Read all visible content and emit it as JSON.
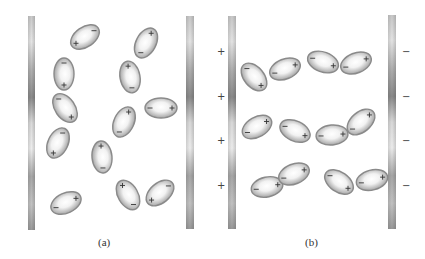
{
  "figure": {
    "panels": [
      {
        "id": "a",
        "caption": "(a)",
        "caption_pos": [
          106,
          248
        ],
        "plates": [
          {
            "name": "left-plate",
            "x": 28,
            "y": 16,
            "w": 7,
            "h": 214
          },
          {
            "name": "right-plate",
            "x": 186,
            "y": 16,
            "w": 8,
            "h": 213
          }
        ],
        "side_signs": [],
        "dipoles": [
          {
            "cx": 85,
            "cy": 37,
            "angle": -35,
            "plus_end": "neg"
          },
          {
            "cx": 146,
            "cy": 43,
            "angle": -62,
            "plus_end": "pos"
          },
          {
            "cx": 64,
            "cy": 74,
            "angle": 90,
            "plus_end": "pos"
          },
          {
            "cx": 130,
            "cy": 77,
            "angle": 80,
            "plus_end": "neg"
          },
          {
            "cx": 65,
            "cy": 108,
            "angle": 55,
            "plus_end": "pos"
          },
          {
            "cx": 161,
            "cy": 108,
            "angle": 0,
            "plus_end": "pos"
          },
          {
            "cx": 124,
            "cy": 122,
            "angle": -65,
            "plus_end": "pos"
          },
          {
            "cx": 58,
            "cy": 143,
            "angle": -65,
            "plus_end": "neg"
          },
          {
            "cx": 102,
            "cy": 157,
            "angle": 85,
            "plus_end": "neg"
          },
          {
            "cx": 128,
            "cy": 195,
            "angle": 60,
            "plus_end": "neg"
          },
          {
            "cx": 160,
            "cy": 193,
            "angle": -40,
            "plus_end": "neg"
          },
          {
            "cx": 66,
            "cy": 203,
            "angle": -25,
            "plus_end": "pos"
          }
        ]
      },
      {
        "id": "b",
        "caption": "(b)",
        "caption_pos": [
          313,
          248
        ],
        "plates": [
          {
            "name": "left-plate",
            "x": 228,
            "y": 16,
            "w": 8,
            "h": 213
          },
          {
            "name": "right-plate",
            "x": 388,
            "y": 15,
            "w": 8,
            "h": 214
          }
        ],
        "side_signs": [
          {
            "text": "+",
            "x": 217,
            "y": 47
          },
          {
            "text": "+",
            "x": 217,
            "y": 92
          },
          {
            "text": "+",
            "x": 217,
            "y": 136
          },
          {
            "text": "+",
            "x": 217,
            "y": 181
          },
          {
            "text": "−",
            "x": 402,
            "y": 47
          },
          {
            "text": "−",
            "x": 402,
            "y": 92
          },
          {
            "text": "−",
            "x": 402,
            "y": 136
          },
          {
            "text": "−",
            "x": 402,
            "y": 181
          }
        ],
        "dipoles": [
          {
            "cx": 254,
            "cy": 77,
            "angle": 50,
            "plus_end": "pos"
          },
          {
            "cx": 285,
            "cy": 69,
            "angle": -22,
            "plus_end": "pos"
          },
          {
            "cx": 323,
            "cy": 62,
            "angle": 20,
            "plus_end": "pos"
          },
          {
            "cx": 356,
            "cy": 63,
            "angle": -22,
            "plus_end": "pos"
          },
          {
            "cx": 257,
            "cy": 127,
            "angle": -30,
            "plus_end": "pos"
          },
          {
            "cx": 295,
            "cy": 131,
            "angle": 25,
            "plus_end": "pos"
          },
          {
            "cx": 332,
            "cy": 135,
            "angle": -5,
            "plus_end": "pos"
          },
          {
            "cx": 361,
            "cy": 122,
            "angle": -40,
            "plus_end": "pos"
          },
          {
            "cx": 267,
            "cy": 187,
            "angle": -12,
            "plus_end": "pos"
          },
          {
            "cx": 294,
            "cy": 174,
            "angle": -22,
            "plus_end": "pos"
          },
          {
            "cx": 339,
            "cy": 182,
            "angle": 35,
            "plus_end": "pos"
          },
          {
            "cx": 372,
            "cy": 180,
            "angle": -15,
            "plus_end": "pos"
          }
        ]
      }
    ],
    "dipole_size": {
      "rx": 16,
      "ry": 10
    },
    "colors": {
      "dipole_outline": "#8a8a8a",
      "dipole_fill_edge": "#a9a9a9",
      "dipole_fill_center": "#ffffff",
      "plate_dark": "#8c8c8c",
      "plate_light": "#e2e2e2",
      "sign": "#333333"
    },
    "symbols": {
      "plus": "+",
      "minus": "−"
    }
  }
}
